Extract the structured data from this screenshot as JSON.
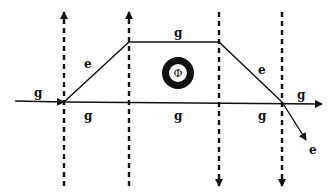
{
  "diagram": {
    "type": "Feynman-style diagram",
    "colors": {
      "line": "#111111",
      "background": "#ffffff"
    },
    "dashed_lines": [
      {
        "x": 64,
        "direction": "up"
      },
      {
        "x": 129,
        "direction": "up"
      },
      {
        "x": 219,
        "direction": "down"
      },
      {
        "x": 282,
        "direction": "down"
      }
    ],
    "labels": {
      "incoming_left": "g",
      "edge_rise": "e",
      "edge_top": "g",
      "edge_fall": "e",
      "outgoing_right": "g",
      "bottom_seg_1": "g",
      "bottom_seg_2": "g",
      "bottom_seg_3": "g",
      "outgoing_e": "e",
      "loop_symbol": "Φ"
    }
  }
}
